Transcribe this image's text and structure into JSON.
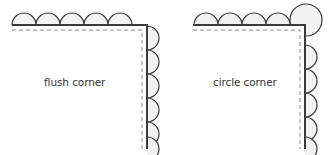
{
  "colors": {
    "stroke": "#3a3a3a",
    "dash": "#8a8a8a",
    "fill": "#f2f2f2",
    "text": "#333333",
    "background": "#ffffff"
  },
  "diagrams": [
    {
      "id": "flush",
      "label": "flush corner",
      "corner_style": "flush",
      "border": {
        "x0": 12,
        "y": 25,
        "x": 147,
        "y1": 149
      },
      "dash": {
        "x0": 12,
        "y": 30,
        "x": 142,
        "y1": 149
      },
      "scallop_radius": 12,
      "top_scallops": [
        24,
        48,
        72,
        96,
        120
      ],
      "side_scallops": [
        38,
        62,
        86,
        110,
        134,
        149
      ],
      "corner_circle": null,
      "label_pos": {
        "left": 44,
        "top": 76
      }
    },
    {
      "id": "circle",
      "label": "circle corner",
      "corner_style": "circle",
      "border": {
        "x0": 193,
        "y": 25,
        "x": 305,
        "y1": 149
      },
      "dash": {
        "x0": 193,
        "y": 30,
        "x": 300,
        "y1": 149
      },
      "scallop_radius": 12,
      "top_scallops": [
        206,
        230,
        254,
        278
      ],
      "side_scallops": [
        57,
        81,
        105,
        129,
        149
      ],
      "corner_circle": {
        "cx": 306,
        "cy": 20,
        "r": 16
      },
      "label_pos": {
        "left": 213,
        "top": 76
      }
    }
  ]
}
